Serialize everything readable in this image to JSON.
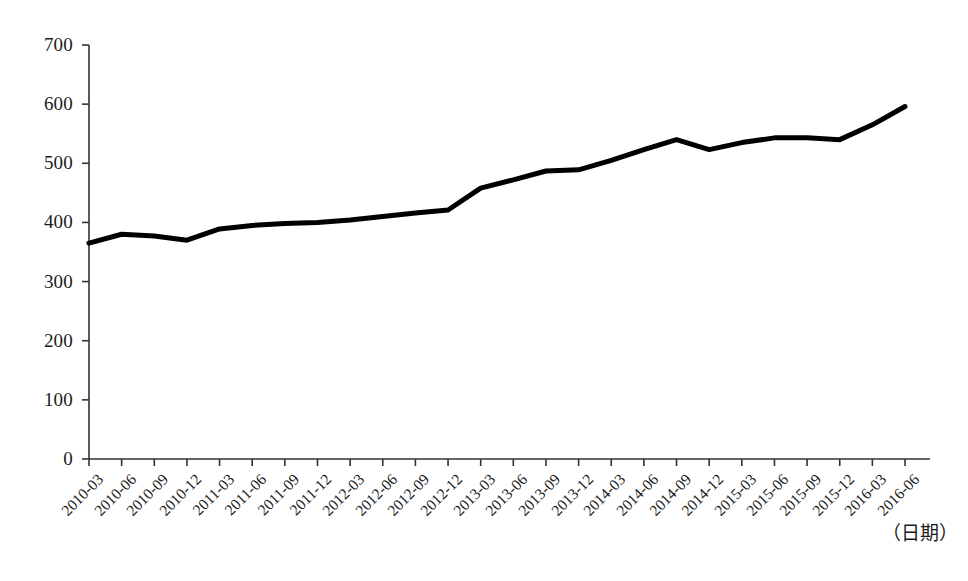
{
  "chart_data": {
    "type": "line",
    "title": "",
    "subtitle": "",
    "xlabel": "（日期）",
    "ylabel": "",
    "grid": false,
    "legend": null,
    "legend_position": "none",
    "line_color": "#000000",
    "line_width_px": 5,
    "xlim_categories": [
      "2010-03",
      "2016-06"
    ],
    "ylim": [
      0,
      700
    ],
    "yticks": [
      0,
      100,
      200,
      300,
      400,
      500,
      600,
      700
    ],
    "ytick_labels": [
      "0",
      "100",
      "200",
      "300",
      "400",
      "500",
      "600",
      "700"
    ],
    "categories": [
      "2010-03",
      "2010-06",
      "2010-09",
      "2010-12",
      "2011-03",
      "2011-06",
      "2011-09",
      "2011-12",
      "2012-03",
      "2012-06",
      "2012-09",
      "2012-12",
      "2013-03",
      "2013-06",
      "2013-09",
      "2013-12",
      "2014-03",
      "2014-06",
      "2014-09",
      "2014-12",
      "2015-03",
      "2015-06",
      "2015-09",
      "2015-12",
      "2016-03",
      "2016-06"
    ],
    "values": [
      365,
      380,
      377,
      370,
      389,
      395,
      398,
      400,
      404,
      410,
      416,
      421,
      458,
      472,
      487,
      489,
      505,
      523,
      540,
      523,
      535,
      543,
      543,
      540,
      565,
      596
    ],
    "series": [
      {
        "name": "series-1",
        "values": [
          365,
          380,
          377,
          370,
          389,
          395,
          398,
          400,
          404,
          410,
          416,
          421,
          458,
          472,
          487,
          489,
          505,
          523,
          540,
          523,
          535,
          543,
          543,
          540,
          565,
          596
        ]
      }
    ],
    "annotations": []
  }
}
